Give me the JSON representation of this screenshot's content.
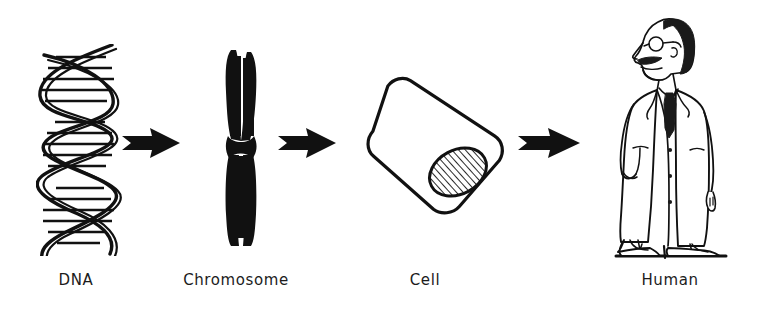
{
  "figure": {
    "type": "diagram",
    "background_color": "#ffffff",
    "ink_color": "#111111",
    "stages": [
      {
        "id": "dna",
        "label": "DNA",
        "icon": "dna-double-helix-icon",
        "order": 1
      },
      {
        "id": "chromosome",
        "label": "Chromosome",
        "icon": "chromosome-icon",
        "order": 2
      },
      {
        "id": "cell",
        "label": "Cell",
        "icon": "cell-with-nucleus-icon",
        "order": 3
      },
      {
        "id": "human",
        "label": "Human",
        "icon": "scientist-figure-icon",
        "order": 4
      }
    ],
    "connectors": [
      {
        "id": "arrow-1",
        "from": "dna",
        "to": "chromosome",
        "direction": "right"
      },
      {
        "id": "arrow-2",
        "from": "chromosome",
        "to": "cell",
        "direction": "right"
      },
      {
        "id": "arrow-3",
        "from": "cell",
        "to": "human",
        "direction": "right"
      }
    ]
  }
}
